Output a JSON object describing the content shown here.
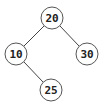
{
  "diagram": {
    "type": "binary-tree",
    "nodes": [
      {
        "id": "n20",
        "label": "20",
        "cx": 52,
        "cy": 18
      },
      {
        "id": "n10",
        "label": "10",
        "cx": 16,
        "cy": 54
      },
      {
        "id": "n30",
        "label": "30",
        "cx": 87,
        "cy": 54
      },
      {
        "id": "n25",
        "label": "25",
        "cx": 51,
        "cy": 90
      }
    ],
    "edges": [
      {
        "from": "n20",
        "to": "n10"
      },
      {
        "from": "n20",
        "to": "n30"
      },
      {
        "from": "n10",
        "to": "n25"
      }
    ],
    "node_radius": 11,
    "colors": {
      "stroke": "#555555",
      "edge": "#444444",
      "text": "#222222",
      "fill": "#ffffff"
    }
  }
}
